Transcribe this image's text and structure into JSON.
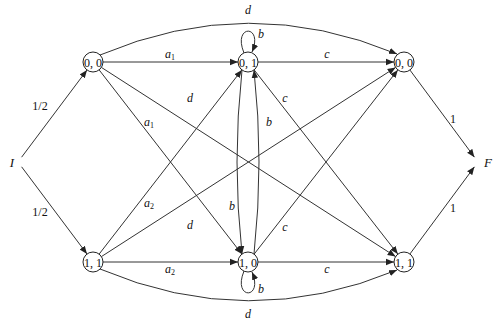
{
  "diagram": {
    "type": "weighted-automaton",
    "initial": {
      "id": "I",
      "label": "I"
    },
    "final": {
      "id": "F",
      "label": "F"
    },
    "nodes": [
      {
        "id": "n00L",
        "label": "0, 0"
      },
      {
        "id": "n01",
        "label": "0, 1"
      },
      {
        "id": "n00R",
        "label": "0, 0"
      },
      {
        "id": "n11L",
        "label": "1, 1"
      },
      {
        "id": "n10",
        "label": "1, 0"
      },
      {
        "id": "n11R",
        "label": "1, 1"
      }
    ],
    "edges": [
      {
        "from": "I",
        "to": "n00L",
        "label": "1/2"
      },
      {
        "from": "I",
        "to": "n11L",
        "label": "1/2"
      },
      {
        "from": "n00L",
        "to": "n01",
        "label": "a",
        "sub": "1"
      },
      {
        "from": "n00L",
        "to": "n10",
        "label": "a",
        "sub": "1"
      },
      {
        "from": "n00L",
        "to": "n11R",
        "label": "d"
      },
      {
        "from": "n00L",
        "to": "n00R",
        "label": "d",
        "curved": "top"
      },
      {
        "from": "n11L",
        "to": "n10",
        "label": "a",
        "sub": "2"
      },
      {
        "from": "n11L",
        "to": "n01",
        "label": "a",
        "sub": "2"
      },
      {
        "from": "n11L",
        "to": "n00R",
        "label": "d"
      },
      {
        "from": "n11L",
        "to": "n11R",
        "label": "d",
        "curved": "bottom"
      },
      {
        "from": "n01",
        "to": "n01",
        "label": "b",
        "loop": "top"
      },
      {
        "from": "n01",
        "to": "n10",
        "label": "b"
      },
      {
        "from": "n10",
        "to": "n01",
        "label": "b"
      },
      {
        "from": "n10",
        "to": "n10",
        "label": "b",
        "loop": "bottom"
      },
      {
        "from": "n01",
        "to": "n00R",
        "label": "c"
      },
      {
        "from": "n01",
        "to": "n11R",
        "label": "c"
      },
      {
        "from": "n10",
        "to": "n11R",
        "label": "c"
      },
      {
        "from": "n10",
        "to": "n00R",
        "label": "c"
      },
      {
        "from": "n00R",
        "to": "F",
        "label": "1"
      },
      {
        "from": "n11R",
        "to": "F",
        "label": "1"
      }
    ]
  }
}
